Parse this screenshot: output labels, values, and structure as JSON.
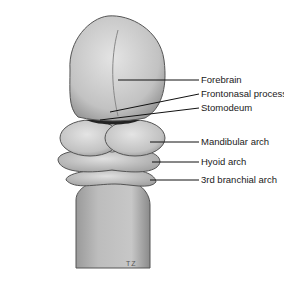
{
  "figure": {
    "labels": [
      {
        "text": "Forebrain",
        "x": 201,
        "y": 80
      },
      {
        "text": "Frontonasal process",
        "x": 201,
        "y": 94
      },
      {
        "text": "Stomodeum",
        "x": 201,
        "y": 108
      },
      {
        "text": "Mandibular arch",
        "x": 201,
        "y": 142
      },
      {
        "text": "Hyoid arch",
        "x": 201,
        "y": 162
      },
      {
        "text": "3rd branchial arch",
        "x": 201,
        "y": 180
      }
    ],
    "initials": "TZ"
  }
}
